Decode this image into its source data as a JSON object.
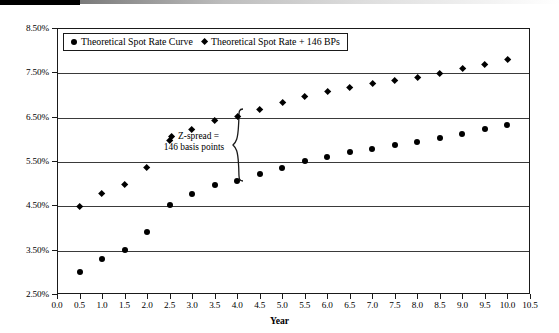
{
  "chart_data": {
    "type": "scatter",
    "title": "",
    "xlabel": "Year",
    "ylabel": "",
    "xlim": [
      0.0,
      10.5
    ],
    "ylim": [
      2.5,
      8.5
    ],
    "grid": true,
    "legend_position": "top-left inside",
    "x_ticks": [
      "0.0",
      "0.5",
      "1.0",
      "1.5",
      "2.0",
      "2.5",
      "3.0",
      "3.5",
      "4.0",
      "4.5",
      "5.0",
      "5.5",
      "6.0",
      "6.5",
      "7.0",
      "7.5",
      "8.0",
      "8.5",
      "9.0",
      "9.5",
      "10.0",
      "10.5"
    ],
    "y_ticks": [
      "2.50%",
      "3.50%",
      "4.50%",
      "5.50%",
      "6.50%",
      "7.50%",
      "8.50%"
    ],
    "x": [
      0.5,
      1.0,
      1.5,
      2.0,
      2.5,
      3.0,
      3.5,
      4.0,
      4.5,
      5.0,
      5.5,
      6.0,
      6.5,
      7.0,
      7.5,
      8.0,
      8.5,
      9.0,
      9.5,
      10.0
    ],
    "series": [
      {
        "name": "Theoretical Spot Rate Curve",
        "marker": "circle",
        "values": [
          3.0,
          3.3,
          3.5,
          3.9,
          4.5,
          4.75,
          4.95,
          5.05,
          5.2,
          5.35,
          5.5,
          5.6,
          5.7,
          5.78,
          5.86,
          5.93,
          6.02,
          6.12,
          6.22,
          6.32
        ]
      },
      {
        "name": "Theoretical Spot Rate + 146 BPs",
        "marker": "diamond",
        "values": [
          4.46,
          4.76,
          4.96,
          5.36,
          5.96,
          6.21,
          6.41,
          6.51,
          6.66,
          6.81,
          6.96,
          7.06,
          7.16,
          7.24,
          7.32,
          7.39,
          7.48,
          7.58,
          7.68,
          7.78
        ]
      }
    ],
    "annotations": [
      {
        "id": "z-spread",
        "line1": "Z-spread =",
        "line2": "146 basis points",
        "marker": "diamond"
      }
    ]
  },
  "legend": {
    "entries": [
      {
        "label": "Theoretical Spot Rate Curve",
        "marker": "circle"
      },
      {
        "label": "Theoretical Spot Rate + 146 BPs",
        "marker": "diamond"
      }
    ]
  },
  "axis": {
    "x_title": "Year"
  }
}
